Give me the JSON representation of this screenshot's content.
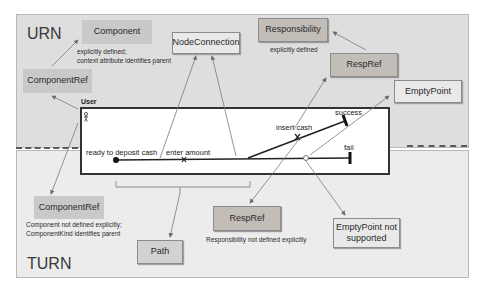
{
  "panels": {
    "urn": {
      "title": "URN"
    },
    "turn": {
      "title": "TURN"
    }
  },
  "urn_boxes": {
    "component": {
      "label": "Component",
      "note_line1": "explicitly defined;",
      "note_line2": "context attribute identifies parent"
    },
    "component_ref": {
      "label": "ComponentRef"
    },
    "node_connection": {
      "label": "NodeConnection"
    },
    "responsibility": {
      "label": "Responsibility",
      "note": "explicitly defined"
    },
    "resp_ref": {
      "label": "RespRef"
    },
    "empty_point": {
      "label": "EmptyPoint"
    }
  },
  "turn_boxes": {
    "component_ref": {
      "label": "ComponentRef",
      "note_line1": "Component not defined explicitly;",
      "note_line2": "ComponentKind identifies parent"
    },
    "path": {
      "label": "Path"
    },
    "resp_ref": {
      "label": "RespRef",
      "note": "Responsibility not defined explicitly"
    },
    "empty_point": {
      "label_line1": "EmptyPoint not",
      "label_line2": "supported"
    }
  },
  "map": {
    "component_label": "User",
    "actor_icon": "actor-icon",
    "start_label": "ready to deposit cash",
    "resp1_label": "enter amount",
    "resp2_label": "insert cash",
    "end1_label": "success",
    "end2_label": "fail"
  },
  "colors": {
    "urn_bg": "#dedede",
    "turn_bg": "#ececec",
    "flat_box": "#c9c9c9",
    "warm_box": "#c3bdb8",
    "light_box": "#e9e9e9",
    "path_stroke": "#222222",
    "arrow_stroke": "#7a7a7a"
  }
}
